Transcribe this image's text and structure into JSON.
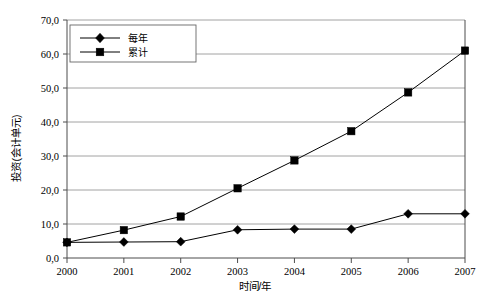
{
  "chart_data": {
    "type": "line",
    "title": "",
    "xlabel": "时间/年",
    "ylabel": "投资(会计单元)",
    "categories": [
      "2000",
      "2001",
      "2002",
      "2003",
      "2004",
      "2005",
      "2006",
      "2007"
    ],
    "x": [
      2000,
      2001,
      2002,
      2003,
      2004,
      2005,
      2006,
      2007
    ],
    "series": [
      {
        "name": "每年",
        "marker": "diamond",
        "color": "#000000",
        "values": [
          4.6,
          4.7,
          4.8,
          8.3,
          8.5,
          8.5,
          13.0,
          13.0
        ]
      },
      {
        "name": "累计",
        "marker": "square",
        "color": "#000000",
        "values": [
          4.6,
          8.2,
          12.2,
          20.5,
          28.7,
          37.3,
          48.7,
          61.0
        ]
      }
    ],
    "ylim": [
      0,
      70
    ],
    "ytick_values": [
      0,
      10,
      20,
      30,
      40,
      50,
      60,
      70
    ],
    "ytick_labels": [
      "0,0",
      "10,0",
      "20,0",
      "30,0",
      "40,0",
      "50,0",
      "60,0",
      "70,0"
    ],
    "xtick_labels": [
      "2000",
      "2001",
      "2002",
      "2003",
      "2004",
      "2005",
      "2006",
      "2007"
    ],
    "grid": "horizontal",
    "legend_position": "top-left",
    "legend_entries": [
      "每年",
      "累计"
    ],
    "background_color": "#ffffff",
    "gridline_color": "#8c8c8c",
    "axis_color": "#4d4d4d"
  }
}
